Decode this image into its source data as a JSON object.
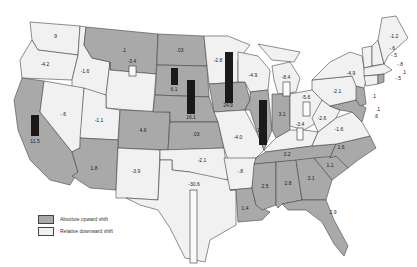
{
  "legend": {
    "up_label": "Absolute upward shift",
    "down_label": "Relative downward shift",
    "up_color": "#a9a9a9",
    "down_color": "#f1f1f1"
  },
  "states": [
    {
      "id": "WA",
      "value": ".9",
      "shift": "down"
    },
    {
      "id": "OR",
      "value": "-4.2",
      "shift": "down"
    },
    {
      "id": "ID",
      "value": "-1.6",
      "shift": "down"
    },
    {
      "id": "MT",
      "value": ".1",
      "shift": "up"
    },
    {
      "id": "WY",
      "value": "-3.4",
      "shift": "down"
    },
    {
      "id": "CA",
      "value": "11.5",
      "shift": "up"
    },
    {
      "id": "NV",
      "value": "-.6",
      "shift": "down"
    },
    {
      "id": "UT",
      "value": "-1.1",
      "shift": "down"
    },
    {
      "id": "CO",
      "value": "4.6",
      "shift": "up"
    },
    {
      "id": "AZ",
      "value": "1.8",
      "shift": "up"
    },
    {
      "id": "NM",
      "value": "-3.9",
      "shift": "down"
    },
    {
      "id": "ND",
      "value": ".03",
      "shift": "up"
    },
    {
      "id": "SD",
      "value": "6.1",
      "shift": "up"
    },
    {
      "id": "NE",
      "value": "16.1",
      "shift": "up"
    },
    {
      "id": "KS",
      "value": ".03",
      "shift": "up"
    },
    {
      "id": "OK",
      "value": "-2.1",
      "shift": "down"
    },
    {
      "id": "TX",
      "value": "-30.6",
      "shift": "down"
    },
    {
      "id": "MN",
      "value": "-2.8",
      "shift": "down"
    },
    {
      "id": "IA",
      "value": "24.9",
      "shift": "up"
    },
    {
      "id": "MO",
      "value": "-4.0",
      "shift": "down"
    },
    {
      "id": "AR",
      "value": "-.8",
      "shift": "down"
    },
    {
      "id": "LA",
      "value": "1.4",
      "shift": "up"
    },
    {
      "id": "WI",
      "value": "-4.9",
      "shift": "down"
    },
    {
      "id": "IL",
      "value": "13.1",
      "shift": "up"
    },
    {
      "id": "MI",
      "value": "-8.4",
      "shift": "down"
    },
    {
      "id": "IN",
      "value": "3.1",
      "shift": "up"
    },
    {
      "id": "OH",
      "value": "-5.6",
      "shift": "down"
    },
    {
      "id": "KY",
      "value": "-3.4",
      "shift": "down"
    },
    {
      "id": "TN",
      "value": "3.2",
      "shift": "up"
    },
    {
      "id": "MS",
      "value": "2.5",
      "shift": "up"
    },
    {
      "id": "AL",
      "value": "2.8",
      "shift": "up"
    },
    {
      "id": "GA",
      "value": "3.1",
      "shift": "up"
    },
    {
      "id": "FL",
      "value": "2.9",
      "shift": "up"
    },
    {
      "id": "SC",
      "value": "1.1",
      "shift": "up"
    },
    {
      "id": "NC",
      "value": "1.6",
      "shift": "up"
    },
    {
      "id": "VA",
      "value": "-1.6",
      "shift": "down"
    },
    {
      "id": "WV",
      "value": "-2.6",
      "shift": "down"
    },
    {
      "id": "PA",
      "value": "-2.1",
      "shift": "down"
    },
    {
      "id": "NY",
      "value": "-4.9",
      "shift": "down"
    },
    {
      "id": "ME",
      "value": "-1.2",
      "shift": "down"
    },
    {
      "id": "NH",
      "value": "-.5",
      "shift": "down"
    },
    {
      "id": "VT",
      "value": "-.6",
      "shift": "down"
    },
    {
      "id": "MA",
      "value": "-.8",
      "shift": "down"
    },
    {
      "id": "CT",
      "value": "-.5",
      "shift": "down"
    },
    {
      "id": "RI",
      "value": ".1",
      "shift": "up"
    },
    {
      "id": "NJ",
      "value": ".1",
      "shift": "up"
    },
    {
      "id": "DE",
      "value": ".1",
      "shift": "up"
    },
    {
      "id": "MD",
      "value": ".6",
      "shift": "up"
    }
  ],
  "labels": {
    "WA": ".9",
    "OR": "-4.2",
    "ID": "-1.6",
    "MT": ".1",
    "WY": "-3.4",
    "CA": "11.5",
    "NV": "-.6",
    "UT": "-1.1",
    "CO": "4.6",
    "AZ": "1.8",
    "NM": "-3.9",
    "ND": ".03",
    "SD": "6.1",
    "NE": "16.1",
    "KS": ".03",
    "OK": "-2.1",
    "TX": "-30.6",
    "MN": "-2.8",
    "IA": "24.9",
    "MO": "-4.0",
    "AR": "-.8",
    "LA": "1.4",
    "WI": "-4.9",
    "IL": "13.1",
    "MI": "-8.4",
    "IN": "3.1",
    "OH": "-5.6",
    "KY": "-3.4",
    "TN": "3.2",
    "MS": "2.5",
    "AL": "2.8",
    "GA": "3.1",
    "FL": "2.9",
    "SC": "1.1",
    "NC": "1.6",
    "VA": "-1.6",
    "WV": "-2.6",
    "PA": "-2.1",
    "NY": "-4.9",
    "ME": "-1.2",
    "NH": "-.5",
    "VT": "-.6",
    "MA": "-.8",
    "CT": "-.5",
    "RI": ".1",
    "NJ": ".1",
    "DE": ".1",
    "MD": ".6"
  }
}
